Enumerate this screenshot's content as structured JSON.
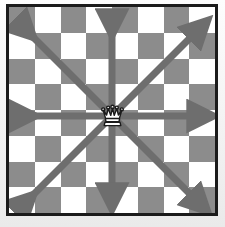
{
  "figure": {
    "board": {
      "columns": 8,
      "rows": 8,
      "light_square_color": "#ffffff",
      "dark_square_color": "#8c8c8c",
      "border_color": "#1b1b1b",
      "background_color": "#f4f4f4"
    },
    "piece": {
      "name": "queen",
      "color": "white",
      "outline_color": "#1b1b1b",
      "file_index": 3,
      "rank_index": 3
    },
    "arrows": {
      "color": "#6e6e6e",
      "count": 8,
      "directions": [
        "up",
        "down",
        "left",
        "right",
        "up-left",
        "up-right",
        "down-left",
        "down-right"
      ]
    }
  }
}
